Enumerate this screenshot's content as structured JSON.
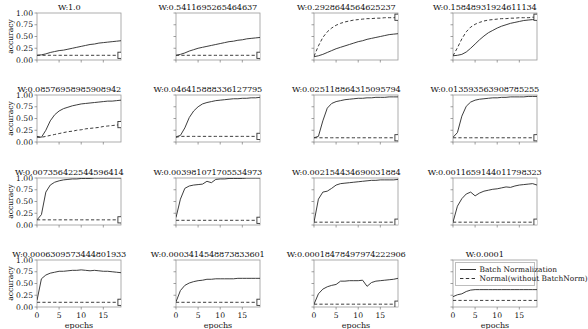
{
  "figure": {
    "xlabel": "epochs",
    "ylabel": "accuracy",
    "yticks": [
      "0.00",
      "0.25",
      "0.50",
      "0.75",
      "1.00"
    ],
    "xticks": [
      "0",
      "5",
      "10",
      "15"
    ],
    "xlim": [
      0,
      19
    ],
    "ylim": [
      0.0,
      1.0
    ],
    "grid": false,
    "rows": 4,
    "cols": 4,
    "line_color": "#333333",
    "marker": "square-open"
  },
  "legend": {
    "position": "bottom-right-panel",
    "entries": [
      {
        "label": "Batch Normalization",
        "style": "solid"
      },
      {
        "label": "Normal(without BatchNorm)",
        "style": "dashed"
      }
    ]
  },
  "chart_data": {
    "type": "line",
    "title": "",
    "xlabel": "epochs",
    "ylabel": "accuracy",
    "xlim": [
      0,
      19
    ],
    "ylim": [
      0.0,
      1.0
    ],
    "xticks": [
      0,
      5,
      10,
      15
    ],
    "yticks": [
      0.0,
      0.25,
      0.5,
      0.75,
      1.0
    ],
    "grid": false,
    "legend": [
      "Batch Normalization",
      "Normal(without BatchNorm)"
    ],
    "x": [
      0,
      1,
      2,
      3,
      4,
      5,
      6,
      7,
      8,
      9,
      10,
      11,
      12,
      13,
      14,
      15,
      16,
      17,
      18,
      19
    ],
    "panels": [
      {
        "title": "W:1.0",
        "series": [
          {
            "name": "Batch Normalization",
            "style": "solid",
            "values": [
              0.1,
              0.11,
              0.13,
              0.16,
              0.18,
              0.2,
              0.21,
              0.23,
              0.25,
              0.27,
              0.29,
              0.31,
              0.33,
              0.34,
              0.36,
              0.37,
              0.38,
              0.39,
              0.4,
              0.41
            ]
          },
          {
            "name": "Normal(without BatchNorm)",
            "style": "dashed",
            "values": [
              0.1,
              0.1,
              0.1,
              0.1,
              0.1,
              0.1,
              0.1,
              0.1,
              0.1,
              0.1,
              0.1,
              0.1,
              0.1,
              0.1,
              0.1,
              0.1,
              0.1,
              0.1,
              0.1,
              0.1
            ]
          }
        ]
      },
      {
        "title": "W:0.5411695265464637",
        "series": [
          {
            "name": "Batch Normalization",
            "style": "solid",
            "values": [
              0.1,
              0.12,
              0.15,
              0.19,
              0.22,
              0.25,
              0.27,
              0.29,
              0.31,
              0.33,
              0.35,
              0.37,
              0.39,
              0.4,
              0.42,
              0.43,
              0.45,
              0.46,
              0.47,
              0.48
            ]
          },
          {
            "name": "Normal(without BatchNorm)",
            "style": "dashed",
            "values": [
              0.1,
              0.1,
              0.1,
              0.1,
              0.1,
              0.1,
              0.1,
              0.1,
              0.1,
              0.1,
              0.1,
              0.1,
              0.1,
              0.1,
              0.1,
              0.1,
              0.1,
              0.1,
              0.1,
              0.1
            ]
          }
        ]
      },
      {
        "title": "W:0.2928644564625237",
        "series": [
          {
            "name": "Batch Normalization",
            "style": "solid",
            "values": [
              0.07,
              0.09,
              0.12,
              0.16,
              0.2,
              0.24,
              0.27,
              0.3,
              0.33,
              0.36,
              0.39,
              0.41,
              0.44,
              0.46,
              0.48,
              0.5,
              0.52,
              0.54,
              0.55,
              0.56
            ]
          },
          {
            "name": "Normal(without BatchNorm)",
            "style": "dashed",
            "values": [
              0.08,
              0.3,
              0.48,
              0.6,
              0.68,
              0.74,
              0.78,
              0.81,
              0.83,
              0.85,
              0.86,
              0.87,
              0.88,
              0.88,
              0.89,
              0.89,
              0.9,
              0.9,
              0.9,
              0.91
            ]
          }
        ]
      },
      {
        "title": "W:0.15848931924611134",
        "series": [
          {
            "name": "Batch Normalization",
            "style": "solid",
            "values": [
              0.09,
              0.1,
              0.12,
              0.17,
              0.25,
              0.34,
              0.43,
              0.51,
              0.58,
              0.63,
              0.68,
              0.72,
              0.75,
              0.78,
              0.8,
              0.82,
              0.84,
              0.85,
              0.86,
              0.87
            ]
          },
          {
            "name": "Normal(without BatchNorm)",
            "style": "dashed",
            "values": [
              0.09,
              0.26,
              0.45,
              0.6,
              0.7,
              0.76,
              0.8,
              0.83,
              0.85,
              0.86,
              0.87,
              0.88,
              0.88,
              0.89,
              0.89,
              0.9,
              0.9,
              0.9,
              0.91,
              0.91
            ]
          }
        ]
      },
      {
        "title": "W:0.08576958985908942",
        "series": [
          {
            "name": "Batch Normalization",
            "style": "solid",
            "values": [
              0.12,
              0.1,
              0.25,
              0.45,
              0.58,
              0.66,
              0.71,
              0.74,
              0.77,
              0.79,
              0.81,
              0.82,
              0.83,
              0.84,
              0.85,
              0.86,
              0.87,
              0.87,
              0.88,
              0.89
            ]
          },
          {
            "name": "Normal(without BatchNorm)",
            "style": "dashed",
            "values": [
              0.1,
              0.1,
              0.12,
              0.14,
              0.16,
              0.18,
              0.2,
              0.22,
              0.23,
              0.25,
              0.26,
              0.28,
              0.29,
              0.3,
              0.31,
              0.33,
              0.34,
              0.35,
              0.36,
              0.37
            ]
          }
        ]
      },
      {
        "title": "W:0.046415888336127795",
        "series": [
          {
            "name": "Batch Normalization",
            "style": "solid",
            "values": [
              0.11,
              0.14,
              0.3,
              0.52,
              0.66,
              0.75,
              0.81,
              0.84,
              0.86,
              0.88,
              0.89,
              0.9,
              0.91,
              0.92,
              0.92,
              0.93,
              0.93,
              0.94,
              0.94,
              0.95
            ]
          },
          {
            "name": "Normal(without BatchNorm)",
            "style": "dashed",
            "values": [
              0.1,
              0.12,
              0.12,
              0.12,
              0.12,
              0.12,
              0.12,
              0.12,
              0.12,
              0.12,
              0.12,
              0.12,
              0.12,
              0.12,
              0.12,
              0.12,
              0.12,
              0.12,
              0.12,
              0.12
            ]
          }
        ]
      },
      {
        "title": "W:0.025118864315095794",
        "series": [
          {
            "name": "Batch Normalization",
            "style": "solid",
            "values": [
              0.09,
              0.12,
              0.45,
              0.72,
              0.82,
              0.86,
              0.88,
              0.9,
              0.91,
              0.92,
              0.93,
              0.93,
              0.94,
              0.94,
              0.95,
              0.95,
              0.95,
              0.96,
              0.96,
              0.96
            ]
          },
          {
            "name": "Normal(without BatchNorm)",
            "style": "dashed",
            "values": [
              0.09,
              0.09,
              0.09,
              0.09,
              0.09,
              0.09,
              0.09,
              0.09,
              0.09,
              0.09,
              0.09,
              0.09,
              0.09,
              0.09,
              0.09,
              0.09,
              0.09,
              0.09,
              0.09,
              0.09
            ]
          }
        ]
      },
      {
        "title": "W:0.013593563908785255",
        "series": [
          {
            "name": "Batch Normalization",
            "style": "solid",
            "values": [
              0.1,
              0.2,
              0.55,
              0.76,
              0.85,
              0.89,
              0.91,
              0.92,
              0.93,
              0.94,
              0.94,
              0.95,
              0.95,
              0.96,
              0.96,
              0.96,
              0.96,
              0.97,
              0.97,
              0.97
            ]
          },
          {
            "name": "Normal(without BatchNorm)",
            "style": "dashed",
            "values": [
              0.09,
              0.09,
              0.09,
              0.09,
              0.09,
              0.09,
              0.09,
              0.09,
              0.09,
              0.09,
              0.09,
              0.09,
              0.09,
              0.09,
              0.09,
              0.09,
              0.09,
              0.09,
              0.09,
              0.09
            ]
          }
        ]
      },
      {
        "title": "W:0.007356422544596414",
        "series": [
          {
            "name": "Batch Normalization",
            "style": "solid",
            "values": [
              0.11,
              0.22,
              0.7,
              0.85,
              0.91,
              0.94,
              0.96,
              0.97,
              0.98,
              0.98,
              0.99,
              0.99,
              0.99,
              1.0,
              1.0,
              1.0,
              1.0,
              1.0,
              1.0,
              1.0
            ]
          },
          {
            "name": "Normal(without BatchNorm)",
            "style": "dashed",
            "values": [
              0.11,
              0.11,
              0.11,
              0.11,
              0.11,
              0.11,
              0.11,
              0.11,
              0.11,
              0.11,
              0.11,
              0.11,
              0.11,
              0.11,
              0.11,
              0.11,
              0.11,
              0.11,
              0.11,
              0.11
            ]
          }
        ]
      },
      {
        "title": "W:0.003981071705534973",
        "series": [
          {
            "name": "Batch Normalization",
            "style": "solid",
            "values": [
              0.16,
              0.55,
              0.78,
              0.83,
              0.85,
              0.86,
              0.87,
              0.93,
              0.9,
              0.97,
              0.98,
              0.98,
              0.99,
              0.99,
              0.99,
              0.99,
              1.0,
              1.0,
              1.0,
              1.0
            ]
          },
          {
            "name": "Normal(without BatchNorm)",
            "style": "dashed",
            "values": [
              0.1,
              0.1,
              0.1,
              0.1,
              0.1,
              0.1,
              0.1,
              0.1,
              0.1,
              0.1,
              0.1,
              0.1,
              0.1,
              0.1,
              0.1,
              0.1,
              0.1,
              0.1,
              0.1,
              0.1
            ]
          }
        ]
      },
      {
        "title": "W:0.002154434690031884",
        "series": [
          {
            "name": "Batch Normalization",
            "style": "solid",
            "values": [
              0.06,
              0.55,
              0.7,
              0.72,
              0.78,
              0.85,
              0.88,
              0.89,
              0.9,
              0.91,
              0.92,
              0.93,
              0.94,
              0.95,
              0.95,
              0.96,
              0.96,
              0.96,
              0.96,
              0.97
            ]
          },
          {
            "name": "Normal(without BatchNorm)",
            "style": "dashed",
            "values": [
              0.06,
              0.06,
              0.06,
              0.06,
              0.06,
              0.06,
              0.06,
              0.06,
              0.06,
              0.06,
              0.06,
              0.06,
              0.06,
              0.06,
              0.06,
              0.06,
              0.06,
              0.06,
              0.06,
              0.06
            ]
          }
        ]
      },
      {
        "title": "W:0.0011659144011798323",
        "series": [
          {
            "name": "Batch Normalization",
            "style": "solid",
            "values": [
              0.06,
              0.4,
              0.56,
              0.66,
              0.7,
              0.62,
              0.68,
              0.72,
              0.74,
              0.76,
              0.77,
              0.79,
              0.81,
              0.8,
              0.83,
              0.85,
              0.86,
              0.87,
              0.88,
              0.85
            ]
          },
          {
            "name": "Normal(without BatchNorm)",
            "style": "dashed",
            "values": [
              0.06,
              0.06,
              0.06,
              0.06,
              0.06,
              0.06,
              0.06,
              0.06,
              0.06,
              0.06,
              0.06,
              0.06,
              0.06,
              0.06,
              0.06,
              0.06,
              0.06,
              0.06,
              0.06,
              0.06
            ]
          }
        ]
      },
      {
        "title": "W:0.0006309573444801933",
        "series": [
          {
            "name": "Batch Normalization",
            "style": "solid",
            "values": [
              0.14,
              0.6,
              0.68,
              0.72,
              0.74,
              0.76,
              0.76,
              0.77,
              0.78,
              0.78,
              0.79,
              0.78,
              0.77,
              0.78,
              0.77,
              0.76,
              0.76,
              0.75,
              0.74,
              0.73
            ]
          },
          {
            "name": "Normal(without BatchNorm)",
            "style": "dashed",
            "values": [
              0.1,
              0.1,
              0.1,
              0.1,
              0.1,
              0.1,
              0.1,
              0.1,
              0.1,
              0.1,
              0.1,
              0.1,
              0.1,
              0.1,
              0.1,
              0.1,
              0.1,
              0.1,
              0.1,
              0.1
            ]
          }
        ]
      },
      {
        "title": "W:0.0003414548873833601",
        "series": [
          {
            "name": "Batch Normalization",
            "style": "solid",
            "values": [
              0.11,
              0.35,
              0.46,
              0.51,
              0.54,
              0.56,
              0.57,
              0.59,
              0.59,
              0.6,
              0.6,
              0.6,
              0.6,
              0.6,
              0.61,
              0.61,
              0.61,
              0.61,
              0.61,
              0.61
            ]
          },
          {
            "name": "Normal(without BatchNorm)",
            "style": "dashed",
            "values": [
              0.1,
              0.1,
              0.1,
              0.1,
              0.1,
              0.1,
              0.1,
              0.1,
              0.1,
              0.1,
              0.1,
              0.1,
              0.1,
              0.1,
              0.1,
              0.1,
              0.1,
              0.1,
              0.1,
              0.1
            ]
          }
        ]
      },
      {
        "title": "W:0.00018478497974222906",
        "series": [
          {
            "name": "Batch Normalization",
            "style": "solid",
            "values": [
              0.06,
              0.28,
              0.38,
              0.43,
              0.46,
              0.48,
              0.55,
              0.55,
              0.56,
              0.56,
              0.56,
              0.57,
              0.44,
              0.52,
              0.55,
              0.56,
              0.57,
              0.58,
              0.59,
              0.61
            ]
          },
          {
            "name": "Normal(without BatchNorm)",
            "style": "dashed",
            "values": [
              0.06,
              0.06,
              0.06,
              0.06,
              0.06,
              0.06,
              0.06,
              0.06,
              0.06,
              0.06,
              0.06,
              0.06,
              0.06,
              0.06,
              0.06,
              0.06,
              0.06,
              0.06,
              0.06,
              0.06
            ]
          }
        ]
      },
      {
        "title": "W:0.0001",
        "series": [
          {
            "name": "Batch Normalization",
            "style": "solid",
            "values": [
              0.22,
              0.26,
              0.28,
              0.33,
              0.36,
              0.37,
              0.37,
              0.37,
              0.37,
              0.37,
              0.37,
              0.37,
              0.37,
              0.37,
              0.37,
              0.37,
              0.37,
              0.37,
              0.37,
              0.37
            ]
          },
          {
            "name": "Normal(without BatchNorm)",
            "style": "dashed",
            "values": [
              0.14,
              0.14,
              0.14,
              0.14,
              0.14,
              0.14,
              0.14,
              0.14,
              0.14,
              0.14,
              0.14,
              0.14,
              0.14,
              0.14,
              0.14,
              0.14,
              0.14,
              0.14,
              0.14,
              0.14
            ]
          }
        ]
      }
    ]
  }
}
